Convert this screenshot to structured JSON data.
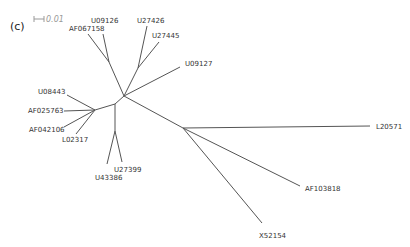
{
  "panel_label": "(c)",
  "scale_bar": {
    "label": "0.01"
  },
  "leaves": [
    {
      "name": "AF067158"
    },
    {
      "name": "U09126"
    },
    {
      "name": "U27426"
    },
    {
      "name": "U27445"
    },
    {
      "name": "U09127"
    },
    {
      "name": "U08443"
    },
    {
      "name": "AF025763"
    },
    {
      "name": "AF042106"
    },
    {
      "name": "L02317"
    },
    {
      "name": "U27399"
    },
    {
      "name": "U43386"
    },
    {
      "name": "L20571"
    },
    {
      "name": "AF103818"
    },
    {
      "name": "X52154"
    }
  ]
}
